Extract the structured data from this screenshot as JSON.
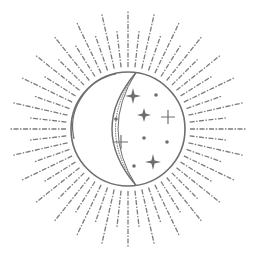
{
  "illustration": {
    "subject": "crescent moon with stars and sun rays",
    "stroke_color": "#6e6e6e",
    "background_color": "#ffffff",
    "center": [
      128,
      129
    ],
    "radius": 57,
    "ray_count": 56,
    "ray_inner": 62,
    "ray_outer_long": 118,
    "ray_outer_short": 100,
    "stars": [
      {
        "type": "sparkle",
        "x": 133,
        "y": 96,
        "size": 8
      },
      {
        "type": "dot",
        "x": 156,
        "y": 95
      },
      {
        "type": "dot",
        "x": 116,
        "y": 119
      },
      {
        "type": "sparkle",
        "x": 144,
        "y": 115,
        "size": 7
      },
      {
        "type": "plus",
        "x": 168,
        "y": 117,
        "size": 7
      },
      {
        "type": "plus",
        "x": 121,
        "y": 142,
        "size": 7
      },
      {
        "type": "dot",
        "x": 144,
        "y": 138
      },
      {
        "type": "dot",
        "x": 167,
        "y": 142
      },
      {
        "type": "dot",
        "x": 134,
        "y": 166
      },
      {
        "type": "sparkle",
        "x": 153,
        "y": 162,
        "size": 8
      }
    ]
  }
}
